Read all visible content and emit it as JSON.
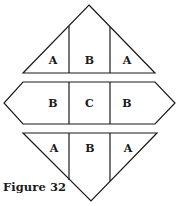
{
  "diagram": {
    "top_triangle": {
      "labels": [
        "A",
        "B",
        "A"
      ]
    },
    "middle_hexagon": {
      "labels": [
        "B",
        "C",
        "B"
      ]
    },
    "bottom_triangle": {
      "labels": [
        "A",
        "B",
        "A"
      ]
    }
  },
  "caption": "Figure 32",
  "colors": {
    "stroke": "#1a1a1a",
    "fill": "#ffffff"
  }
}
